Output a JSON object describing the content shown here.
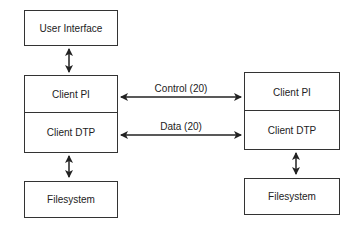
{
  "diagram": {
    "left": {
      "user_interface": "User Interface",
      "client_pi": "Client PI",
      "client_dtp": "Client DTP",
      "filesystem": "Filesystem"
    },
    "right": {
      "client_pi": "Client PI",
      "client_dtp": "Client DTP",
      "filesystem": "Filesystem"
    },
    "connections": {
      "control": "Control (20)",
      "data": "Data (20)"
    }
  }
}
